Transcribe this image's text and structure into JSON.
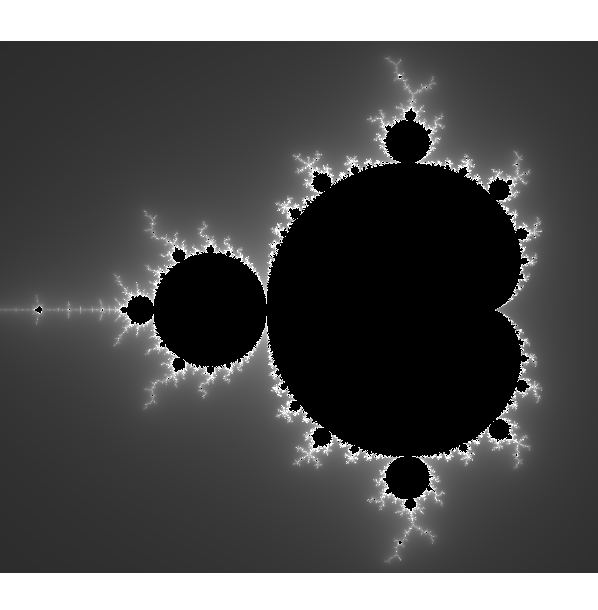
{
  "image": {
    "subject": "Mandelbrot set",
    "description": "Grayscale escape-time rendering of the Mandelbrot set: black interior, bright white filaments at the boundary, smooth falloff to dark gray background",
    "view": {
      "re_min": -1.93,
      "re_max": 0.716,
      "im_min": -1.165,
      "im_max": 1.19
    },
    "max_iterations": 200,
    "colors": {
      "interior": "#000000",
      "boundary_glow": "#ffffff",
      "far_background": "#1f1f1f",
      "page_background": "#ffffff"
    }
  }
}
